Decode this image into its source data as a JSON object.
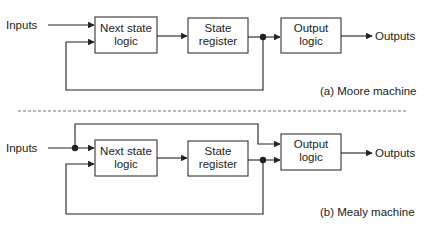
{
  "moore": {
    "inputs_label": "Inputs",
    "next_state_line1": "Next state",
    "next_state_line2": "logic",
    "state_reg_line1": "State",
    "state_reg_line2": "register",
    "output_line1": "Output",
    "output_line2": "logic",
    "outputs_label": "Outputs",
    "caption": "(a) Moore machine"
  },
  "mealy": {
    "inputs_label": "Inputs",
    "next_state_line1": "Next state",
    "next_state_line2": "logic",
    "state_reg_line1": "State",
    "state_reg_line2": "register",
    "output_line1": "Output",
    "output_line2": "logic",
    "outputs_label": "Outputs",
    "caption": "(b) Mealy machine"
  },
  "colors": {
    "line": "#222222",
    "background": "#ffffff"
  }
}
